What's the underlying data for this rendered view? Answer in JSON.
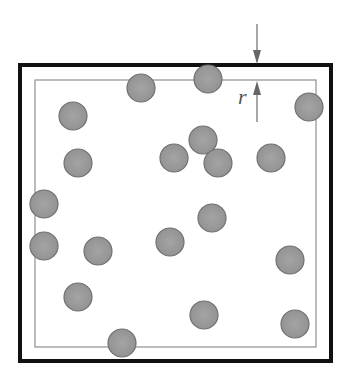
{
  "diagram": {
    "label_r": "r",
    "outer_box": {
      "x": 20,
      "y": 65,
      "w": 311,
      "h": 296,
      "stroke": "#111111",
      "stroke_width": 4
    },
    "inner_box": {
      "x": 35,
      "y": 80,
      "w": 281,
      "h": 267,
      "stroke": "#999999",
      "stroke_width": 1.3
    },
    "circle_style": {
      "radius": 14,
      "fill": "#999999",
      "stroke": "#707070"
    },
    "circles": [
      {
        "cx": 141,
        "cy": 88
      },
      {
        "cx": 208,
        "cy": 79
      },
      {
        "cx": 73,
        "cy": 116
      },
      {
        "cx": 309,
        "cy": 107
      },
      {
        "cx": 78,
        "cy": 163
      },
      {
        "cx": 174,
        "cy": 158
      },
      {
        "cx": 203,
        "cy": 140
      },
      {
        "cx": 218,
        "cy": 163
      },
      {
        "cx": 271,
        "cy": 158
      },
      {
        "cx": 44,
        "cy": 204
      },
      {
        "cx": 44,
        "cy": 246
      },
      {
        "cx": 98,
        "cy": 251
      },
      {
        "cx": 170,
        "cy": 242
      },
      {
        "cx": 212,
        "cy": 218
      },
      {
        "cx": 78,
        "cy": 297
      },
      {
        "cx": 290,
        "cy": 260
      },
      {
        "cx": 204,
        "cy": 315
      },
      {
        "cx": 295,
        "cy": 324
      },
      {
        "cx": 122,
        "cy": 343
      }
    ],
    "dimension_arrow_x": 257
  }
}
